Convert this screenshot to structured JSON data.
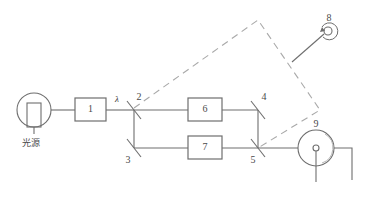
{
  "figure": {
    "type": "optical-interferometer-schematic",
    "stroke_color": "#6e6e6e",
    "dashed_color": "#a9a9a9",
    "text_color": "#4a4a4a"
  },
  "labels": {
    "source_caption": "光源",
    "wavelength": "λ",
    "component_1": "1",
    "component_2": "2",
    "component_3": "3",
    "component_4": "4",
    "component_5": "5",
    "component_6": "6",
    "component_7": "7",
    "component_8": "8",
    "component_9": "9"
  },
  "components": [
    {
      "id": "1",
      "kind": "box",
      "label": "1"
    },
    {
      "id": "2",
      "kind": "beam-splitter",
      "label": "2"
    },
    {
      "id": "3",
      "kind": "beam-splitter",
      "label": "3"
    },
    {
      "id": "4",
      "kind": "beam-splitter",
      "label": "4"
    },
    {
      "id": "5",
      "kind": "beam-splitter",
      "label": "5"
    },
    {
      "id": "6",
      "kind": "box",
      "label": "6"
    },
    {
      "id": "7",
      "kind": "box",
      "label": "7"
    },
    {
      "id": "8",
      "kind": "rotating-knob",
      "label": "8"
    },
    {
      "id": "9",
      "kind": "detector-wheel",
      "label": "9"
    },
    {
      "id": "source",
      "kind": "lamp",
      "label": "光源"
    }
  ]
}
